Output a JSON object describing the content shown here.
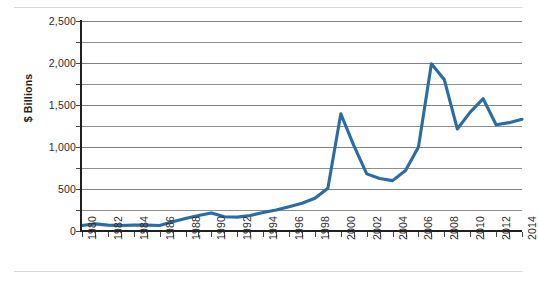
{
  "chart_data": {
    "type": "line",
    "title": "",
    "subtitle": "",
    "xlabel": "",
    "ylabel": "$ Billions",
    "ylim": [
      0,
      2500
    ],
    "xlim": [
      1980,
      2014
    ],
    "grid": true,
    "legend": false,
    "legend_position": "none",
    "y_major_step": 500,
    "y_minor_step": 250,
    "x_tick_step": 1,
    "x_label_step": 2,
    "line_color": "#2b6ca3",
    "x": [
      1980,
      1981,
      1982,
      1983,
      1984,
      1985,
      1986,
      1987,
      1988,
      1989,
      1990,
      1991,
      1992,
      1993,
      1994,
      1995,
      1996,
      1997,
      1998,
      1999,
      2000,
      2001,
      2002,
      2003,
      2004,
      2005,
      2006,
      2007,
      2008,
      2009,
      2010,
      2011,
      2012,
      2013,
      2014
    ],
    "values": [
      65,
      85,
      70,
      65,
      70,
      70,
      65,
      110,
      150,
      185,
      215,
      170,
      165,
      185,
      220,
      250,
      290,
      330,
      390,
      510,
      1395,
      1020,
      680,
      625,
      600,
      720,
      1000,
      1990,
      1800,
      1215,
      1415,
      1575,
      1265,
      1290,
      1330
    ],
    "y_ticks": [
      0,
      500,
      1000,
      1500,
      2000,
      2500
    ],
    "y_tick_labels": [
      "0",
      "500",
      "1,000",
      "1,500",
      "2,000",
      "2,500"
    ],
    "y_minor_ticks": [
      250,
      750,
      1250,
      1750,
      2250
    ],
    "x_tick_labels": [
      "1980",
      "1982",
      "1984",
      "1986",
      "1988",
      "1990",
      "1992",
      "1994",
      "1996",
      "1998",
      "2000",
      "2002",
      "2004",
      "2006",
      "2008",
      "2010",
      "2012",
      "2014"
    ]
  }
}
